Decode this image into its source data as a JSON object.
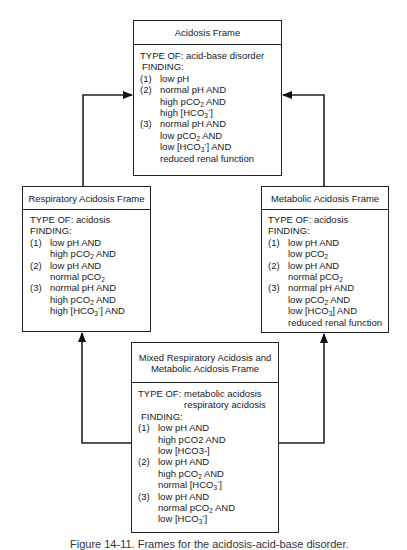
{
  "frames": {
    "acidosis": {
      "title": "Acidosis Frame",
      "type_of_label": "TYPE OF:",
      "type_of": "acid-base disorder",
      "finding_label": "FINDING:",
      "findings": [
        {
          "num": "(1)",
          "lines": [
            "low pH"
          ]
        },
        {
          "num": "(2)",
          "lines": [
            "normal pH AND",
            "high pCO2 AND",
            "high [HCO3-]"
          ]
        },
        {
          "num": "(3)",
          "lines": [
            "normal pH AND",
            "low pCO2 AND",
            "low [HCO3-] AND",
            "reduced renal function"
          ]
        }
      ]
    },
    "respiratory": {
      "title": "Respiratory Acidosis Frame",
      "type_of_label": "TYPE OF:",
      "type_of": "acidosis",
      "finding_label": "FINDING:",
      "findings": [
        {
          "num": "(1)",
          "lines": [
            "low pH AND",
            "high pCO2 AND"
          ]
        },
        {
          "num": "(2)",
          "lines": [
            "low pH AND",
            "normal pCO2"
          ]
        },
        {
          "num": "(3)",
          "lines": [
            "normal pH AND",
            "high pCO2 AND",
            "high [HCO3-] AND"
          ]
        }
      ]
    },
    "metabolic": {
      "title": "Metabolic Acidosis Frame",
      "type_of_label": "TYPE OF:",
      "type_of": "acidosis",
      "finding_label": "FINDING:",
      "findings": [
        {
          "num": "(1)",
          "lines": [
            "low pH AND",
            "low pCO2"
          ]
        },
        {
          "num": "(2)",
          "lines": [
            "low pH AND",
            "normal pCO2"
          ]
        },
        {
          "num": "(3)",
          "lines": [
            "normal pH AND",
            "low pCO2 AND",
            "low [HCO3] AND",
            "reduced renal function"
          ]
        }
      ]
    },
    "mixed": {
      "title_line1": "Mixed Respiratory Acidosis and",
      "title_line2": "Metabolic Acidosis Frame",
      "type_of_label": "TYPE OF:",
      "type_of": [
        "metabolic acidosis",
        "respiratory acidosis"
      ],
      "finding_label": "FINDING:",
      "findings": [
        {
          "num": "(1)",
          "lines": [
            "low pH AND",
            "high pCO2 AND",
            "low [HCO3-]"
          ]
        },
        {
          "num": "(2)",
          "lines": [
            "low pH AND",
            "high pCO2 AND",
            "normal [HCO3-]"
          ]
        },
        {
          "num": "(3)",
          "lines": [
            "low pH AND",
            "normal pCO2 AND",
            "low [HCO3-]"
          ]
        }
      ]
    }
  },
  "edges": [
    {
      "from": "respiratory",
      "to": "acidosis"
    },
    {
      "from": "metabolic",
      "to": "acidosis"
    },
    {
      "from": "mixed",
      "to": "respiratory"
    },
    {
      "from": "mixed",
      "to": "metabolic"
    }
  ],
  "caption": "Figure 14-11. Frames for the acidosis-acid-base disorder."
}
